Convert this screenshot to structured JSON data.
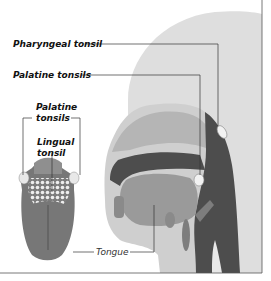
{
  "diagram": {
    "labels": {
      "pharyngeal_tonsil": "Pharyngeal tonsil",
      "palatine_tonsils_side": "Palatine tonsils",
      "palatine_tonsils_tongue_line1": "Palatine",
      "palatine_tonsils_tongue_line2": "tonsils",
      "lingual_tonsil_line1": "Lingual",
      "lingual_tonsil_line2": "tonsil",
      "tongue": "Tongue"
    },
    "colors": {
      "head_light": "#dcdcdc",
      "head_mid": "#b9b9b9",
      "tissue_dark": "#4a4a4a",
      "tongue_fill": "#7a7a7a",
      "tonsil_white": "#f2f2f2",
      "leader_line": "#333333",
      "border": "#555555"
    }
  }
}
